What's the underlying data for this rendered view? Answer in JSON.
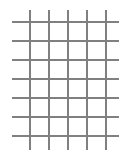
{
  "canvas": {
    "width": 132,
    "height": 158,
    "background_color": "#ffffff",
    "title": "Grid"
  },
  "chart_data": {
    "type": "line",
    "title": "",
    "subtitle": "",
    "xlabel": "",
    "ylabel": "",
    "grid": true,
    "legend": null,
    "line_color": "#808080",
    "line_width_px": 2,
    "vertical_lines": {
      "count": 5,
      "x": [
        29,
        48,
        67,
        86,
        105
      ],
      "y_start": 10,
      "y_end": 150,
      "spacing": 19
    },
    "horizontal_lines": {
      "count": 7,
      "y": [
        21,
        40,
        59,
        78,
        97,
        116,
        135
      ],
      "x_start": 12,
      "x_end": 119,
      "spacing": 19
    },
    "cells": {
      "columns": 4,
      "rows": 6,
      "cell_width": 19,
      "cell_height": 19
    },
    "xlim": [
      0,
      132
    ],
    "ylim": [
      0,
      158
    ]
  }
}
